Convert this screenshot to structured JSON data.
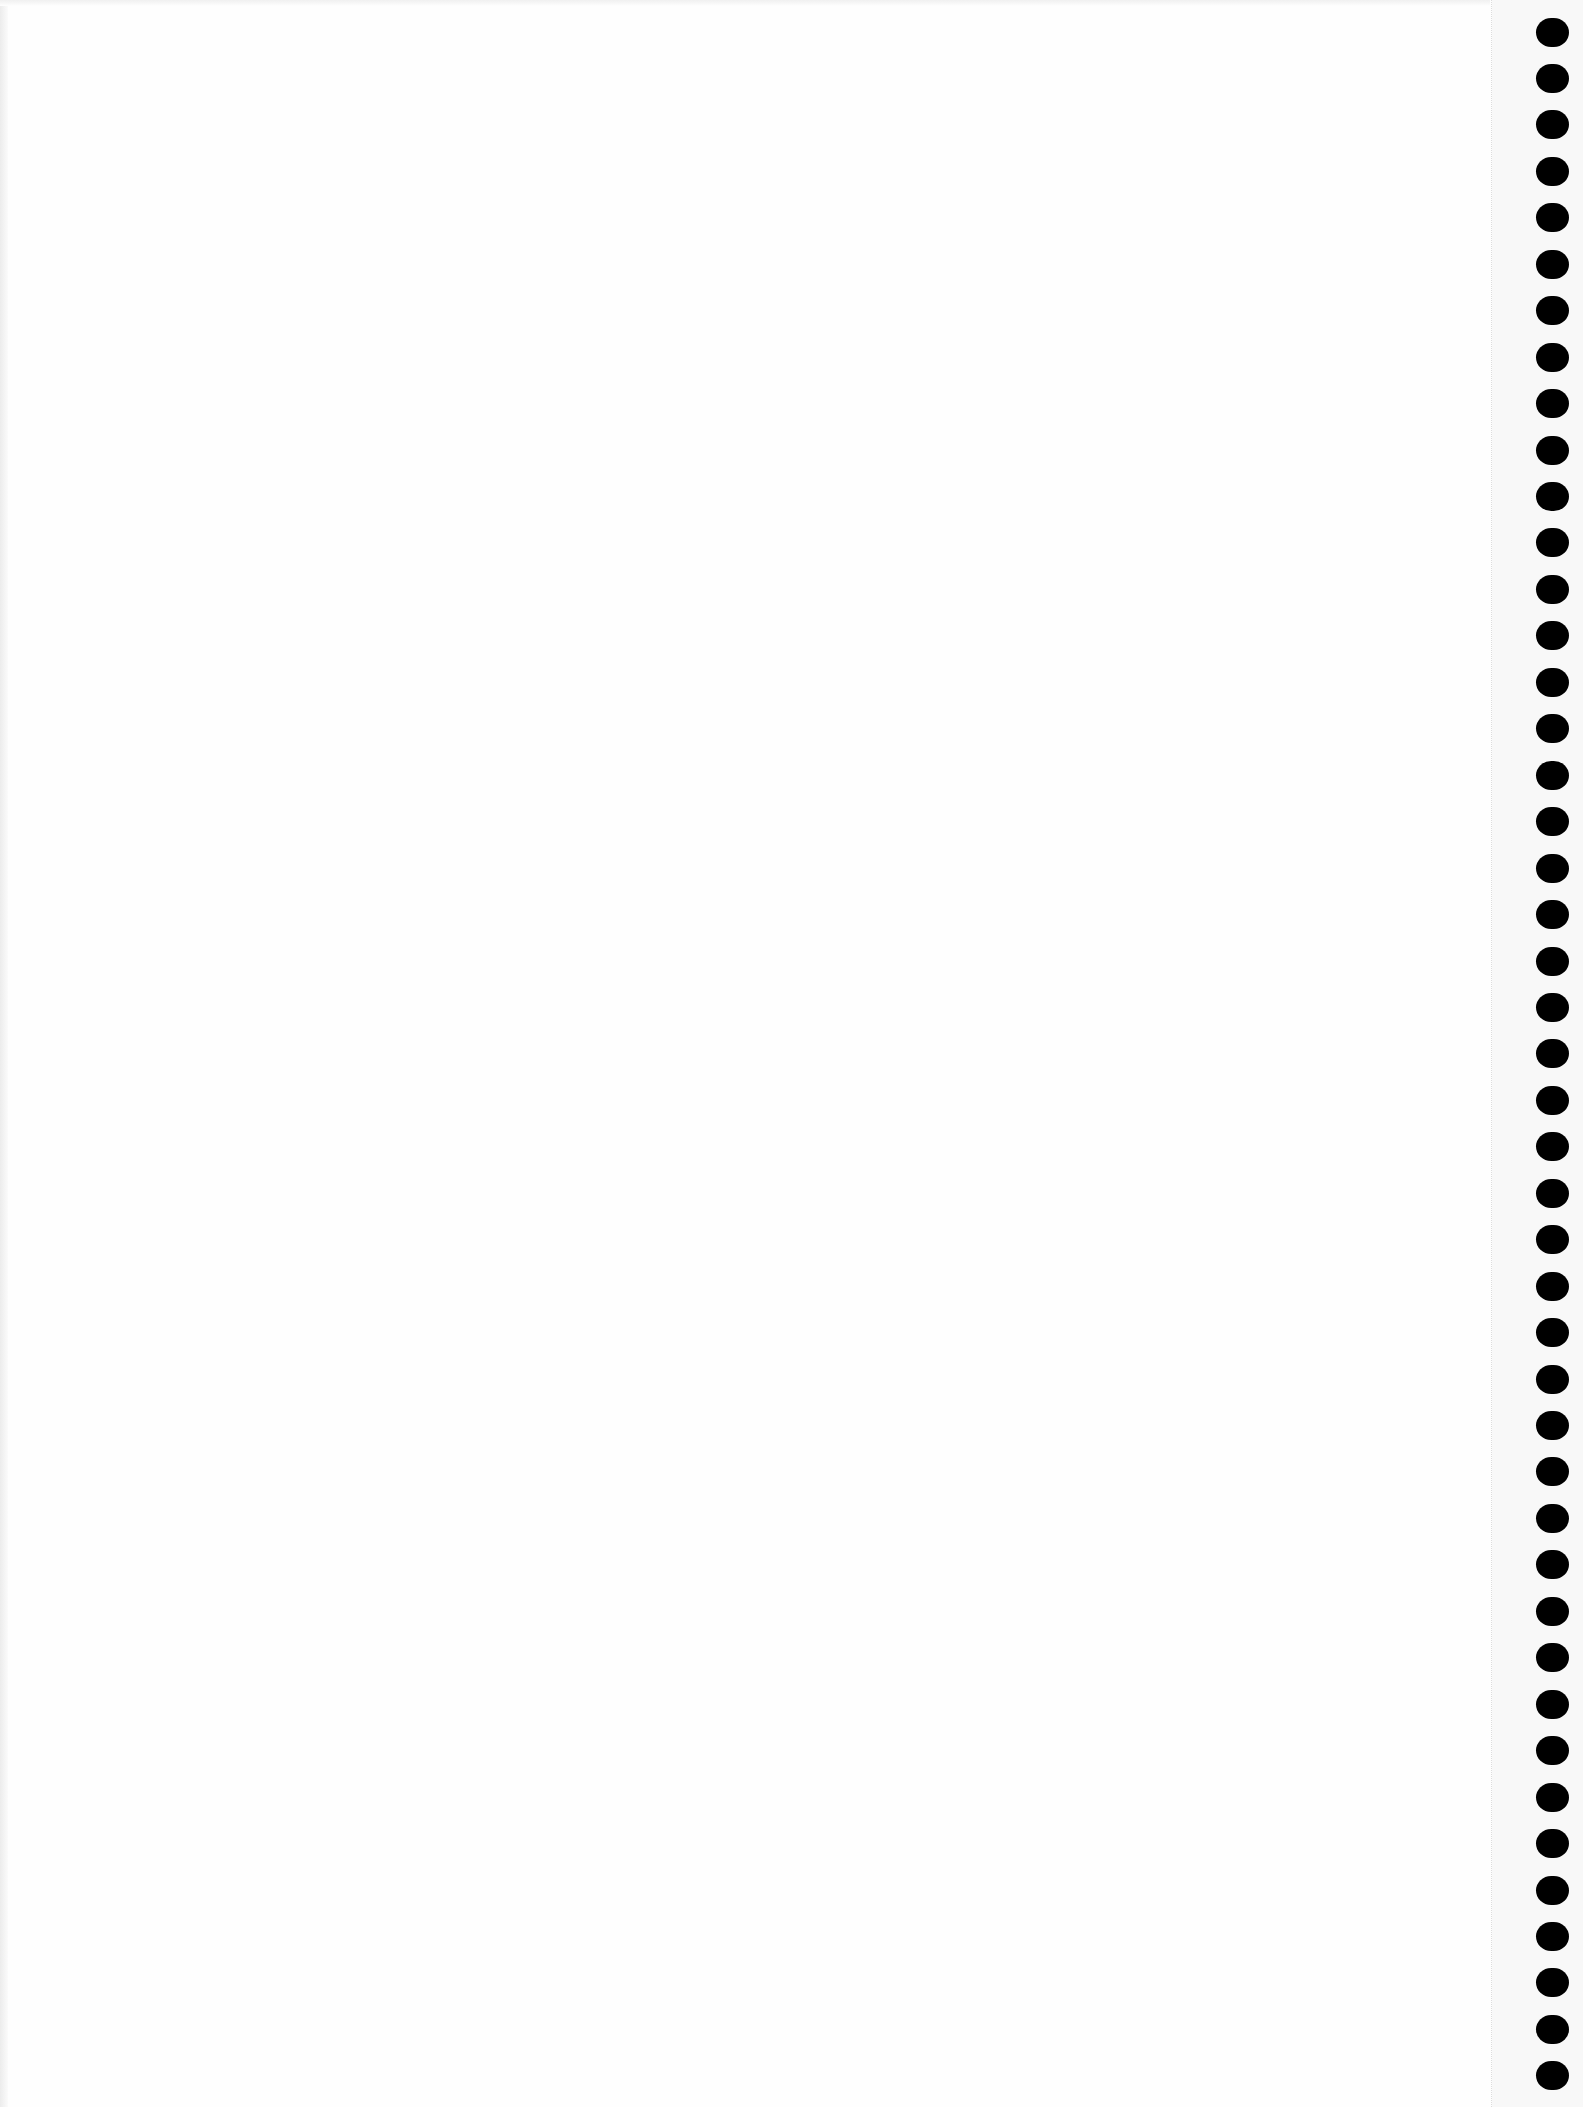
{
  "page": {
    "type": "blank-continuous-form-sheet",
    "background_color": "#fefefe",
    "content_text": ""
  },
  "binder_holes": {
    "count": 45,
    "color": "#000000",
    "center_x": 1552,
    "first_center_y": 32,
    "spacing_y": 46.45,
    "width": 33,
    "height": 29
  },
  "perforation": {
    "x": 1491,
    "style": "dotted",
    "color": "#dcdcdc"
  }
}
